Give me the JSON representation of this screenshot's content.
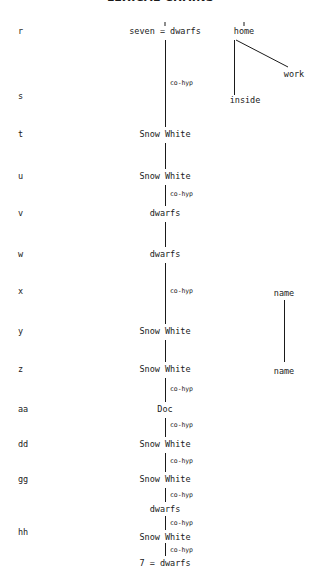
{
  "figure": {
    "title": "LEXICAL CHAINS",
    "relation_label": "co-hyp",
    "line_color": "#1a1a1a",
    "background_color": "#ffffff"
  },
  "row_labels": [
    {
      "id": "r",
      "text": "r",
      "y": 30
    },
    {
      "id": "s",
      "text": "s",
      "y": 95
    },
    {
      "id": "t",
      "text": "t",
      "y": 133
    },
    {
      "id": "u",
      "text": "u",
      "y": 175
    },
    {
      "id": "v",
      "text": "v",
      "y": 212
    },
    {
      "id": "w",
      "text": "w",
      "y": 253
    },
    {
      "id": "x",
      "text": "x",
      "y": 290
    },
    {
      "id": "y",
      "text": "y",
      "y": 330
    },
    {
      "id": "z",
      "text": "z",
      "y": 368
    },
    {
      "id": "aa",
      "text": "aa",
      "y": 408
    },
    {
      "id": "dd",
      "text": "dd",
      "y": 443
    },
    {
      "id": "gg",
      "text": "gg",
      "y": 478
    },
    {
      "id": "hh",
      "text": "hh",
      "y": 531
    }
  ],
  "main_chain": {
    "name": "snow-white-dwarfs-chain",
    "x": 165,
    "nodes": [
      {
        "row": "r",
        "text": "seven = dwarfs",
        "y": 30
      },
      {
        "row": "t",
        "text": "Snow White",
        "y": 133
      },
      {
        "row": "u",
        "text": "Snow White",
        "y": 175
      },
      {
        "row": "v",
        "text": "dwarfs",
        "y": 212
      },
      {
        "row": "w",
        "text": "dwarfs",
        "y": 253
      },
      {
        "row": "y",
        "text": "Snow White",
        "y": 330
      },
      {
        "row": "z",
        "text": "Snow White",
        "y": 368
      },
      {
        "row": "aa",
        "text": "Doc",
        "y": 408
      },
      {
        "row": "dd",
        "text": "Snow White",
        "y": 443
      },
      {
        "row": "gg",
        "text": "Snow White",
        "y": 478
      },
      {
        "row": "gg",
        "text": "dwarfs",
        "y": 508
      },
      {
        "row": "hh",
        "text": "Snow White",
        "y": 536
      },
      {
        "row": "hh",
        "text": "7 = dwarfs",
        "y": 562
      }
    ],
    "edge_labels": [
      {
        "text": "co-hyp",
        "y": 82
      },
      {
        "text": "co-hyp",
        "y": 193
      },
      {
        "text": "co-hyp",
        "y": 290
      },
      {
        "text": "co-hyp",
        "y": 388
      },
      {
        "text": "co-hyp",
        "y": 424
      },
      {
        "text": "co-hyp",
        "y": 460
      },
      {
        "text": "co-hyp",
        "y": 494
      },
      {
        "text": "co-hyp",
        "y": 522
      },
      {
        "text": "co-hyp",
        "y": 549
      }
    ]
  },
  "home_branch": {
    "name": "home-branch",
    "nodes": [
      {
        "row": "r",
        "text": "home",
        "x": 244,
        "y": 30
      },
      {
        "row": "r",
        "text": "work",
        "x": 294,
        "y": 73
      },
      {
        "row": "s",
        "text": "inside",
        "x": 245,
        "y": 99
      }
    ]
  },
  "name_chain": {
    "name": "name-chain",
    "x": 284,
    "nodes": [
      {
        "row": "x",
        "text": "name",
        "y": 292
      },
      {
        "row": "z",
        "text": "name",
        "y": 370
      }
    ]
  }
}
